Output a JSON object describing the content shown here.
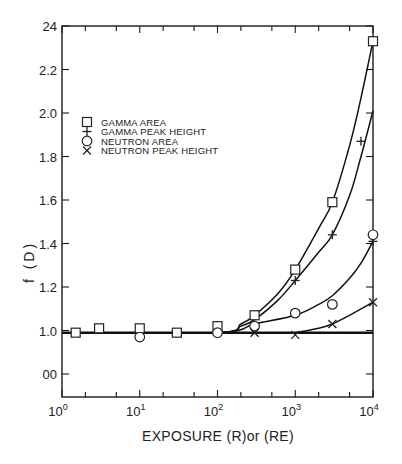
{
  "chart_data": {
    "type": "scatter",
    "title": "",
    "xlabel": "EXPOSURE (R)or (RE)",
    "ylabel": "f (D)",
    "xscale": "log",
    "xlim": [
      1,
      10000
    ],
    "ylim": [
      0.7,
      2.4
    ],
    "grid": false,
    "legend_position": "upper-left",
    "x_ticks": [
      {
        "base": "10",
        "exp": "0",
        "value": 1
      },
      {
        "base": "10",
        "exp": "1",
        "value": 10
      },
      {
        "base": "10",
        "exp": "2",
        "value": 100
      },
      {
        "base": "10",
        "exp": "3",
        "value": 1000
      },
      {
        "base": "10",
        "exp": "4",
        "value": 10000
      }
    ],
    "y_ticks": [
      {
        "label": "24",
        "value": 2.4
      },
      {
        "label": "2.2",
        "value": 2.2
      },
      {
        "label": "2.0",
        "value": 2.0
      },
      {
        "label": "1.8",
        "value": 1.8
      },
      {
        "label": "1.6",
        "value": 1.6
      },
      {
        "label": "1.4",
        "value": 1.4
      },
      {
        "label": "1.2",
        "value": 1.2
      },
      {
        "label": "1.0",
        "value": 1.0
      },
      {
        "label": "00",
        "value": 0.8
      }
    ],
    "series": [
      {
        "name": "GAMMA AREA",
        "marker": "square",
        "points": [
          [
            1.5,
            0.99
          ],
          [
            3,
            1.01
          ],
          [
            10,
            1.01
          ],
          [
            30,
            0.99
          ],
          [
            100,
            1.02
          ],
          [
            300,
            1.07
          ],
          [
            1000,
            1.28
          ],
          [
            3000,
            1.59
          ],
          [
            10000,
            2.33
          ]
        ],
        "curve": [
          [
            1,
            0.99
          ],
          [
            100,
            0.99
          ],
          [
            200,
            1.03
          ],
          [
            300,
            1.07
          ],
          [
            600,
            1.17
          ],
          [
            1000,
            1.28
          ],
          [
            2000,
            1.47
          ],
          [
            3000,
            1.59
          ],
          [
            5000,
            1.85
          ],
          [
            7000,
            2.07
          ],
          [
            10000,
            2.33
          ]
        ]
      },
      {
        "name": "GAMMA PEAK HEIGHT",
        "marker": "plus",
        "points": [
          [
            1000,
            1.23
          ],
          [
            3000,
            1.44
          ],
          [
            7000,
            1.87
          ],
          [
            10000,
            1.41
          ]
        ],
        "curve": [
          [
            1,
            0.99
          ],
          [
            100,
            0.99
          ],
          [
            200,
            1.02
          ],
          [
            300,
            1.05
          ],
          [
            600,
            1.14
          ],
          [
            1000,
            1.23
          ],
          [
            2000,
            1.36
          ],
          [
            3000,
            1.44
          ],
          [
            5000,
            1.62
          ],
          [
            7000,
            1.8
          ],
          [
            10000,
            2.01
          ]
        ]
      },
      {
        "name": "NEUTRON AREA",
        "marker": "circle",
        "points": [
          [
            10,
            0.97
          ],
          [
            100,
            0.99
          ],
          [
            300,
            1.02
          ],
          [
            1000,
            1.08
          ],
          [
            3000,
            1.12
          ],
          [
            10000,
            1.44
          ]
        ],
        "curve": [
          [
            1,
            0.99
          ],
          [
            100,
            0.99
          ],
          [
            300,
            1.03
          ],
          [
            1000,
            1.07
          ],
          [
            2000,
            1.12
          ],
          [
            3000,
            1.16
          ],
          [
            5000,
            1.24
          ],
          [
            7000,
            1.31
          ],
          [
            10000,
            1.41
          ]
        ]
      },
      {
        "name": "NEUTRON PEAK HEIGHT",
        "marker": "cross",
        "points": [
          [
            300,
            0.99
          ],
          [
            1000,
            0.98
          ],
          [
            3000,
            1.03
          ],
          [
            10000,
            1.13
          ]
        ],
        "curve": [
          [
            1000,
            0.99
          ],
          [
            2000,
            1.01
          ],
          [
            3000,
            1.03
          ],
          [
            5000,
            1.07
          ],
          [
            10000,
            1.13
          ]
        ]
      }
    ],
    "baseline": {
      "y": 0.99,
      "x_range": [
        1,
        10000
      ]
    }
  },
  "legend": {
    "items": [
      {
        "symbol": "square",
        "label": "GAMMA AREA"
      },
      {
        "symbol": "plus",
        "label": "GAMMA PEAK HEIGHT"
      },
      {
        "symbol": "circle",
        "label": "NEUTRON AREA"
      },
      {
        "symbol": "cross",
        "label": "NEUTRON PEAK HEIGHT"
      }
    ]
  },
  "axes": {
    "x_title": "EXPOSURE (R)or (RE)",
    "y_title": "f (D)"
  }
}
